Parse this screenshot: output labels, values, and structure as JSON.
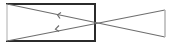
{
  "diagram": {
    "width": 175,
    "height": 46,
    "colors": {
      "box_stroke": "#2b2b2b",
      "box_left_stroke": "#c8c8c8",
      "line_stroke": "#6e6e6e",
      "right_edge_stroke": "#b4b4b4",
      "arrow_stroke": "#6e6e6e",
      "background": "#ffffff"
    },
    "box": {
      "x": 7,
      "y": 4,
      "width": 88,
      "height": 37
    },
    "crossing_lines": [
      {
        "from": [
          7,
          4
        ],
        "to": [
          165,
          37
        ]
      },
      {
        "from": [
          7,
          41
        ],
        "to": [
          165,
          10
        ]
      }
    ],
    "right_edge": {
      "x": 165,
      "y1": 10,
      "y2": 37
    },
    "arrows": [
      {
        "direction": "left",
        "at": [
          58,
          15
        ]
      },
      {
        "direction": "left",
        "at": [
          56,
          29
        ]
      }
    ]
  }
}
